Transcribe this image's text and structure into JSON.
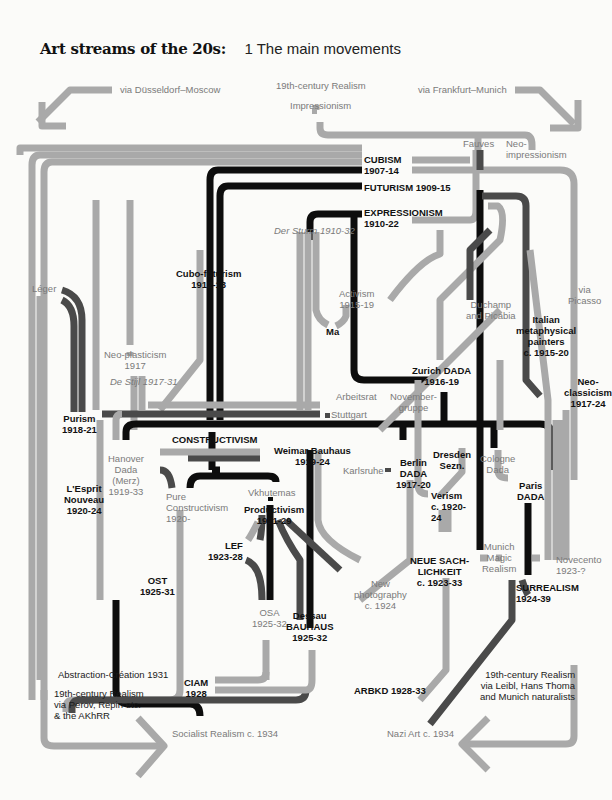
{
  "header": {
    "title": "Art streams of the 20s:",
    "subtitle": "1 The main movements"
  },
  "colors": {
    "light_stream": "#a9a9a9",
    "dark_stream": "#4a4a4a",
    "black_stream": "#0d0d0d",
    "background": "#fbfbf9"
  },
  "inputs": {
    "via_dusseldorf": "via Düsseldorf–Moscow",
    "realism_19c": "19th-century Realism",
    "impressionism": "Impressionism",
    "via_frankfurt": "via Frankfurt–Munich",
    "fauves": "Fauves",
    "neo_impressionism": "Neo-\nimpressionism",
    "leger": "Léger",
    "via_picasso": "via\nPicasso"
  },
  "movements": {
    "cubism": "CUBISM\n1907-14",
    "futurism": "FUTURISM 1909-15",
    "expressionism": "EXPRESSIONISM\n1910-22",
    "der_sturm": "Der Sturm 1910-32",
    "cubo_futurism": "Cubo-futurism\n1912-18",
    "activism": "Activism\n1915-19",
    "ma": "Ma",
    "duchamp": "Duchamp\nand Picabia",
    "italian_meta": "Italian\nmetaphysical\npainters\nc. 1915-20",
    "neo_plasticism": "Neo-plasticism\n1917",
    "de_stijl": "De Stijl 1917-31",
    "zurich_dada": "Zurich DADA\n1916-19",
    "neoclassicism": "Neo-\nclassicism\n1917-24",
    "arbeitsrat": "Arbeitsrat",
    "novembergruppe": "November-\ngruppe",
    "stuttgart": "Stuttgart",
    "purism": "Purism\n1918-21",
    "constructivism": "CONSTRUCTIVISM",
    "weimar_bauhaus": "Weimar Bauhaus\n1919-24",
    "berlin_dada": "Berlin\nDADA\n1917-20",
    "dresden_sezn": "Dresden\nSezn.",
    "cologne_dada": "Cologne\nDada",
    "paris_dada": "Paris\nDADA",
    "karlsruhe": "Karlsruhe",
    "hanover_dada": "Hanover\nDada\n(Merz)\n1919-33",
    "lesprit": "L'Esprit\nNouveau\n1920-24",
    "pure_constructivism": "Pure\nConstructivism\n1920-",
    "vkhutemas": "Vkhutemas",
    "productivism": "Productivism\n1921-29",
    "verism": "Verism\nc. 1920-\n24",
    "lef": "LEF\n1923-28",
    "ost": "OST\n1925-31",
    "neue_sachlichkeit": "NEUE SACH-\nLICHKEIT\nc. 1923-33",
    "munich_magic": "Munich\nMagic\nRealism",
    "novecento": "Novecento\n1923-?",
    "new_photography": "New\nphotography\nc. 1924",
    "surrealism": "SURREALISM\n1924-39",
    "osa": "OSA\n1925-32",
    "dessau_bauhaus": "Dessau\nBAUHAUS\n1925-32",
    "abstraction_creation": "Abstraction-Création 1931",
    "ciam": "CIAM\n1928",
    "arbkd": "ARBKD 1928-33"
  },
  "outputs": {
    "realism_perov": "19th-century Realism\nvia Perov, Repin etc.\n& the AKhRR",
    "socialist_realism": "Socialist Realism c. 1934",
    "realism_leibl": "19th-century Realism\nvia Leibl, Hans Thoma\nand Munich naturalists",
    "nazi_art": "Nazi Art c. 1934"
  }
}
